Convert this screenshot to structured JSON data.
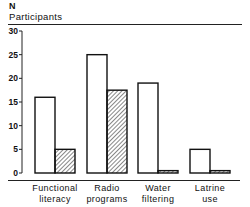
{
  "chart_data": {
    "type": "bar",
    "title": "",
    "ylabel_top": "N",
    "ylabel": "Participants",
    "xlabel": "",
    "categories": [
      "Functional literacy",
      "Radio programs",
      "Water filtering",
      "Latrine use"
    ],
    "category_lines": [
      [
        "Functional",
        "literacy"
      ],
      [
        "Radio",
        "programs"
      ],
      [
        "Water",
        "filtering"
      ],
      [
        "Latrine",
        "use"
      ]
    ],
    "series": [
      {
        "name": "Series A (white)",
        "fill": "white",
        "values": [
          16,
          25,
          19,
          5
        ]
      },
      {
        "name": "Series B (hatched)",
        "fill": "hatched",
        "values": [
          5,
          17.5,
          0.5,
          0.5
        ]
      }
    ],
    "ylim": [
      0,
      30
    ],
    "yticks": [
      0,
      5,
      10,
      15,
      20,
      25,
      30
    ],
    "grid": false,
    "legend": "none"
  }
}
